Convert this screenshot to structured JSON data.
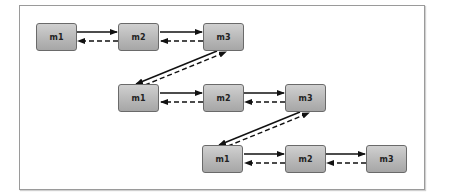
{
  "diagram": {
    "rows": [
      {
        "nodes": [
          {
            "label": "m1"
          },
          {
            "label": "m2"
          },
          {
            "label": "m3"
          }
        ]
      },
      {
        "nodes": [
          {
            "label": "m1"
          },
          {
            "label": "m2"
          },
          {
            "label": "m3"
          }
        ]
      },
      {
        "nodes": [
          {
            "label": "m1"
          },
          {
            "label": "m2"
          },
          {
            "label": "m3"
          }
        ]
      }
    ],
    "edge_styles": {
      "forward": "solid",
      "backward": "dashed"
    },
    "colors": {
      "node_fill": "#b8b8b8",
      "node_border": "#6a6a6a",
      "edge": "#111111",
      "frame": "#9a9a9a"
    }
  }
}
